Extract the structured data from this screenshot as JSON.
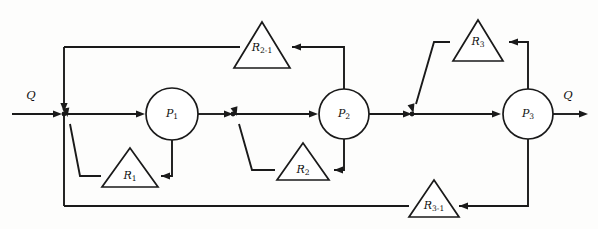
{
  "figure": {
    "title": "",
    "type": "process-flow-diagram",
    "width": 598,
    "height": 229,
    "background_color": "#fdfdfc",
    "line_color": "#1a1a1a"
  },
  "flow_labels": {
    "inlet": "Q",
    "outlet": "Q"
  },
  "process_nodes": [
    {
      "id": "P1",
      "base": "P",
      "sub": "1",
      "cx": 172,
      "cy": 114,
      "r": 26
    },
    {
      "id": "P2",
      "base": "P",
      "sub": "2",
      "cx": 344,
      "cy": 114,
      "r": 25
    },
    {
      "id": "P3",
      "base": "P",
      "sub": "3",
      "cx": 528,
      "cy": 114,
      "r": 25
    }
  ],
  "recycle_nodes": [
    {
      "id": "R1",
      "base": "R",
      "sub": "1",
      "apex_x": 130,
      "apex_y": 148,
      "half_w": 28,
      "base_y": 187
    },
    {
      "id": "R2",
      "base": "R",
      "sub": "2",
      "apex_x": 303,
      "apex_y": 143,
      "half_w": 26,
      "base_y": 180
    },
    {
      "id": "R3",
      "base": "R",
      "sub": "3",
      "apex_x": 478,
      "apex_y": 20,
      "half_w": 25,
      "base_y": 61
    },
    {
      "id": "R2-1",
      "base": "R",
      "sub": "2-1",
      "apex_x": 262,
      "apex_y": 22,
      "half_w": 28,
      "base_y": 68
    },
    {
      "id": "R3-1",
      "base": "R",
      "sub": "3-1",
      "apex_x": 434,
      "apex_y": 180,
      "half_w": 25,
      "base_y": 217
    }
  ],
  "junctions": [
    {
      "id": "J1",
      "x": 64,
      "y": 114
    },
    {
      "id": "J2",
      "x": 233,
      "y": 114
    },
    {
      "id": "J3",
      "x": 412,
      "y": 114
    }
  ],
  "main_line": {
    "y": 114,
    "inlet_start_x": 12,
    "outlet_end_x": 588
  }
}
